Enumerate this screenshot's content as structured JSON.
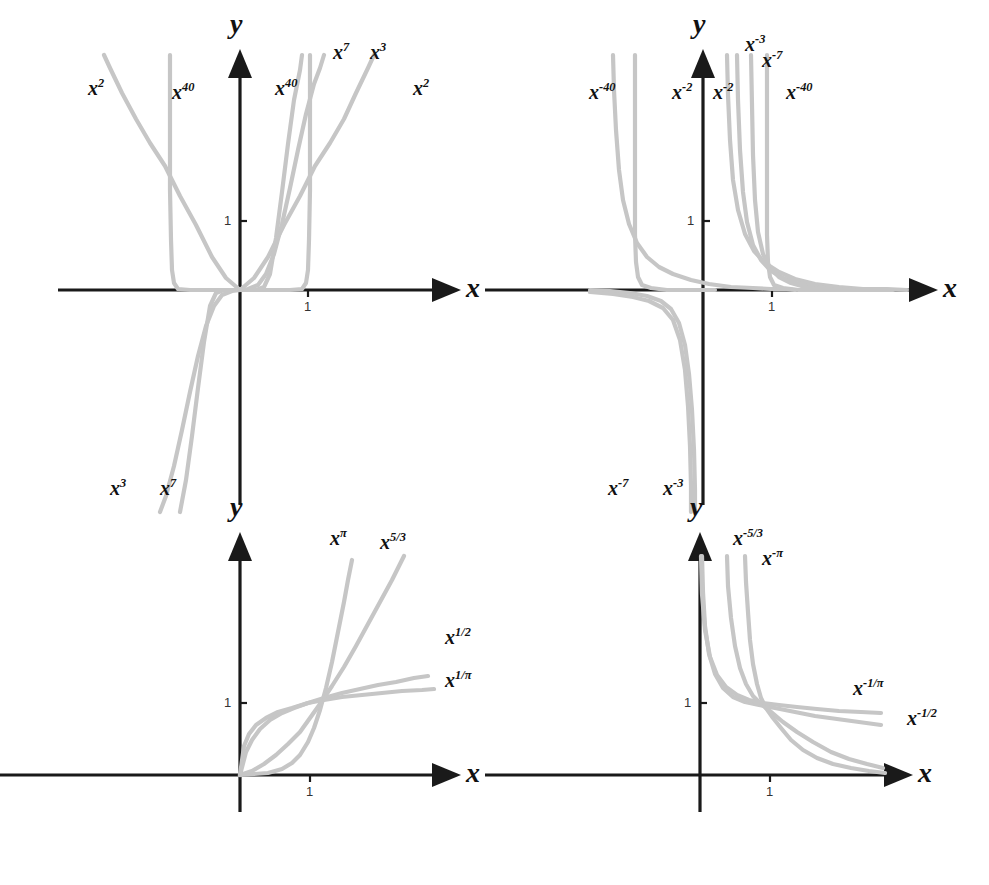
{
  "figure": {
    "curve_color": "#c6c6c6",
    "axis_color": "#1a1a1a",
    "background": "#ffffff",
    "caption": ""
  },
  "axis_labels": {
    "x": "x",
    "y": "y",
    "tick_one": "1"
  },
  "panels": [
    {
      "id": "top-left",
      "name": "even-and-odd-positive-integer-powers",
      "description": "Power functions with positive integer exponents, shown for positive and negative x",
      "labels": [
        {
          "key": "p2-left",
          "base": "x",
          "exp": "2",
          "x": 88,
          "y": 78
        },
        {
          "key": "p40-left",
          "base": "x",
          "exp": "40",
          "x": 172,
          "y": 82
        },
        {
          "key": "p40-right",
          "base": "x",
          "exp": "40",
          "x": 275,
          "y": 78
        },
        {
          "key": "p7-right",
          "base": "x",
          "exp": "7",
          "x": 333,
          "y": 42
        },
        {
          "key": "p3-right",
          "base": "x",
          "exp": "3",
          "x": 370,
          "y": 42
        },
        {
          "key": "p2-right",
          "base": "x",
          "exp": "2",
          "x": 413,
          "y": 78
        },
        {
          "key": "p3-lower",
          "base": "x",
          "exp": "3",
          "x": 110,
          "y": 478
        },
        {
          "key": "p7-lower",
          "base": "x",
          "exp": "7",
          "x": 160,
          "y": 478
        }
      ]
    },
    {
      "id": "top-right",
      "name": "negative-integer-powers",
      "description": "Power functions with negative integer exponents, shown for positive and negative x",
      "labels": [
        {
          "key": "n40-left",
          "base": "x",
          "exp": "-40",
          "x": 589,
          "y": 82
        },
        {
          "key": "n2-left",
          "base": "x",
          "exp": "-2",
          "x": 672,
          "y": 82
        },
        {
          "key": "n2-right",
          "base": "x",
          "exp": "-2",
          "x": 713,
          "y": 82
        },
        {
          "key": "n3-right",
          "base": "x",
          "exp": "-3",
          "x": 745,
          "y": 34
        },
        {
          "key": "n7-right",
          "base": "x",
          "exp": "-7",
          "x": 762,
          "y": 50
        },
        {
          "key": "n40-right",
          "base": "x",
          "exp": "-40",
          "x": 786,
          "y": 82
        },
        {
          "key": "n7-lower",
          "base": "x",
          "exp": "-7",
          "x": 608,
          "y": 478
        },
        {
          "key": "n3-lower",
          "base": "x",
          "exp": "-3",
          "x": 663,
          "y": 478
        }
      ]
    },
    {
      "id": "bottom-left",
      "name": "positive-fractional-and-irrational-powers",
      "description": "Power functions with positive real exponents on x greater than zero",
      "labels": [
        {
          "key": "pi",
          "base": "x",
          "exp": "π",
          "x": 330,
          "y": 528
        },
        {
          "key": "5over3",
          "base": "x",
          "exp": "5/3",
          "x": 380,
          "y": 532
        },
        {
          "key": "1over2",
          "base": "x",
          "exp": "1/2",
          "x": 445,
          "y": 627
        },
        {
          "key": "1overpi",
          "base": "x",
          "exp": "1/π",
          "x": 445,
          "y": 670
        }
      ]
    },
    {
      "id": "bottom-right",
      "name": "negative-fractional-and-irrational-powers",
      "description": "Power functions with negative real exponents on x greater than zero",
      "labels": [
        {
          "key": "n5over3",
          "base": "x",
          "exp": "-5/3",
          "x": 733,
          "y": 528
        },
        {
          "key": "npi",
          "base": "x",
          "exp": "-π",
          "x": 762,
          "y": 548
        },
        {
          "key": "n1overpi",
          "base": "x",
          "exp": "-1/π",
          "x": 853,
          "y": 678
        },
        {
          "key": "n1over2",
          "base": "x",
          "exp": "-1/2",
          "x": 907,
          "y": 708
        }
      ]
    }
  ],
  "chart_data": {
    "type": "line",
    "xlabel": "x",
    "ylabel": "y",
    "grid": false,
    "legend": "inline curve labels",
    "panels": [
      {
        "panel": "top-left",
        "xlim": [
          -2.6,
          3.0
        ],
        "ylim": [
          -3.2,
          3.2
        ],
        "x_ticks": [
          1
        ],
        "y_ticks": [
          1
        ],
        "series": [
          {
            "name": "x^2",
            "exponent": 2,
            "domain": "all real x",
            "parity": "even"
          },
          {
            "name": "x^3",
            "exponent": 3,
            "domain": "all real x",
            "parity": "odd"
          },
          {
            "name": "x^7",
            "exponent": 7,
            "domain": "all real x",
            "parity": "odd"
          },
          {
            "name": "x^40",
            "exponent": 40,
            "domain": "all real x",
            "parity": "even"
          }
        ]
      },
      {
        "panel": "top-right",
        "xlim": [
          -2.6,
          3.0
        ],
        "ylim": [
          -3.2,
          3.2
        ],
        "x_ticks": [
          1
        ],
        "y_ticks": [
          1
        ],
        "series": [
          {
            "name": "x^-2",
            "exponent": -2,
            "domain": "x not equal 0",
            "parity": "even"
          },
          {
            "name": "x^-3",
            "exponent": -3,
            "domain": "x not equal 0",
            "parity": "odd"
          },
          {
            "name": "x^-7",
            "exponent": -7,
            "domain": "x not equal 0",
            "parity": "odd"
          },
          {
            "name": "x^-40",
            "exponent": -40,
            "domain": "x not equal 0",
            "parity": "even"
          }
        ]
      },
      {
        "panel": "bottom-left",
        "xlim": [
          -1.2,
          2.9
        ],
        "ylim": [
          -0.6,
          2.6
        ],
        "x_ticks": [
          1
        ],
        "y_ticks": [
          1
        ],
        "series": [
          {
            "name": "x^pi",
            "exponent": 3.14159,
            "domain": "x greater than or equal 0"
          },
          {
            "name": "x^5/3",
            "exponent": 1.66667,
            "domain": "x greater than or equal 0"
          },
          {
            "name": "x^1/2",
            "exponent": 0.5,
            "domain": "x greater than or equal 0"
          },
          {
            "name": "x^1/pi",
            "exponent": 0.31831,
            "domain": "x greater than or equal 0"
          }
        ]
      },
      {
        "panel": "bottom-right",
        "xlim": [
          -1.2,
          3.3
        ],
        "ylim": [
          -0.6,
          2.6
        ],
        "x_ticks": [
          1
        ],
        "y_ticks": [
          1
        ],
        "series": [
          {
            "name": "x^-5/3",
            "exponent": -1.66667,
            "domain": "x greater than 0"
          },
          {
            "name": "x^-pi",
            "exponent": -3.14159,
            "domain": "x greater than 0"
          },
          {
            "name": "x^-1/2",
            "exponent": -0.5,
            "domain": "x greater than 0"
          },
          {
            "name": "x^-1/pi",
            "exponent": -0.31831,
            "domain": "x greater than 0"
          }
        ]
      }
    ]
  }
}
